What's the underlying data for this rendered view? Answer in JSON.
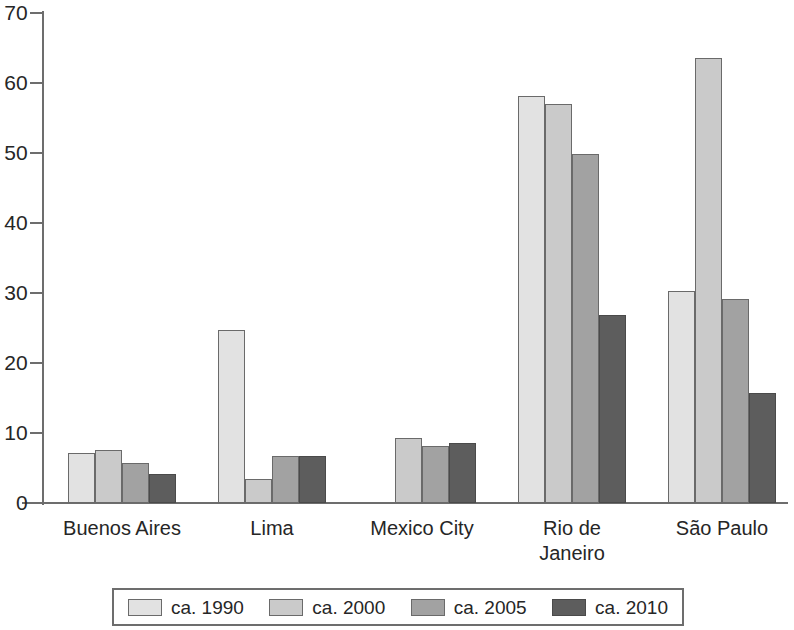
{
  "chart_data": {
    "type": "bar",
    "title": "",
    "subtitle": "",
    "xlabel": "",
    "ylabel": "",
    "ylim": [
      0,
      70
    ],
    "yticks": [
      0,
      10,
      20,
      30,
      40,
      50,
      60,
      70
    ],
    "ytick_labels": [
      "0",
      "10",
      "20",
      "30",
      "40",
      "50",
      "60",
      "70"
    ],
    "grid": false,
    "legend_position": "bottom",
    "categories": [
      "Buenos Aires",
      "Lima",
      "Mexico City",
      "Rio de\nJaneiro",
      "São Paulo"
    ],
    "series": [
      {
        "name": "ca. 1990",
        "color": "#e2e2e2",
        "values": [
          7.1,
          24.7,
          0,
          58.2,
          30.3
        ]
      },
      {
        "name": "ca. 2000",
        "color": "#cacaca",
        "values": [
          7.6,
          3.4,
          9.3,
          57.0,
          63.6
        ]
      },
      {
        "name": "ca. 2005",
        "color": "#a2a2a2",
        "values": [
          5.7,
          6.7,
          8.2,
          49.8,
          29.2
        ]
      },
      {
        "name": "ca. 2010",
        "color": "#5d5d5d",
        "values": [
          4.1,
          6.7,
          8.6,
          26.8,
          15.7
        ]
      }
    ]
  },
  "legend": {
    "items": [
      {
        "label": "ca. 1990"
      },
      {
        "label": "ca. 2000"
      },
      {
        "label": "ca. 2005"
      },
      {
        "label": "ca. 2010"
      }
    ]
  },
  "axis": {
    "y_labels": [
      "70",
      "60",
      "50",
      "40",
      "30",
      "20",
      "10",
      "0"
    ]
  }
}
